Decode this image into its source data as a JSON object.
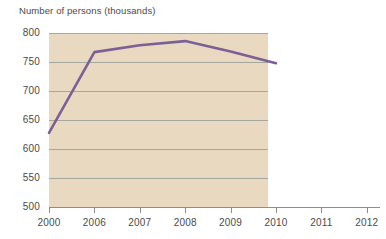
{
  "chart_data": {
    "type": "line",
    "title": "Number of persons (thousands)",
    "xlabel": "",
    "ylabel": "Number of persons (thousands)",
    "x": [
      "2000",
      "2006",
      "2007",
      "2008",
      "2009",
      "2010",
      "2011",
      "2012"
    ],
    "categories": [
      "2000",
      "2006",
      "2007",
      "2008",
      "2009",
      "2010",
      "2011",
      "2012"
    ],
    "series": [
      {
        "name": "Number of persons (thousands)",
        "x": [
          "2000",
          "2006",
          "2007",
          "2008",
          "2009",
          "2010"
        ],
        "values": [
          628,
          767,
          779,
          786,
          768,
          748
        ],
        "color": "#7d5f96"
      }
    ],
    "values": [
      628,
      767,
      779,
      786,
      768,
      748,
      null,
      null
    ],
    "ylim": [
      500,
      800
    ],
    "yticks": [
      500,
      550,
      600,
      650,
      700,
      750,
      800
    ],
    "ytick_labels": [
      "500",
      "550",
      "600",
      "650",
      "700",
      "750",
      "800"
    ],
    "xtick_labels": [
      "2000",
      "2006",
      "2007",
      "2008",
      "2009",
      "2010",
      "2011",
      "2012"
    ],
    "grid": true,
    "grid_axis": "y",
    "legend": false,
    "plot_background": "#e8d9c0",
    "page_background": "#ffffff",
    "grid_color": "#9aa39a",
    "axis_color": "#8d8d8d",
    "text_color": "#4a4a4a",
    "line_color": "#7d5f96",
    "line_width": 2.6,
    "shaded_x_range": [
      "2000",
      "2010"
    ],
    "annotations": []
  },
  "layout": {
    "plot_left_px": 49,
    "plot_right_px": 268,
    "plot_top_px": 33,
    "plot_bottom_px": 207,
    "axis_right_px": 380,
    "tick_spacing_px": 45.4
  }
}
